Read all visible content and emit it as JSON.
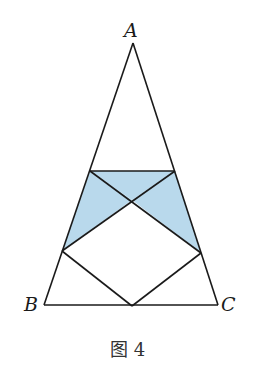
{
  "figure": {
    "caption": "图 4",
    "colors": {
      "shade": "#b9d9ec",
      "stroke": "#1a1a1a",
      "background": "#ffffff"
    },
    "labels": {
      "A": "A",
      "B": "B",
      "C": "C"
    },
    "points": {
      "A": [
        133,
        43
      ],
      "B": [
        44,
        305
      ],
      "C": [
        218,
        305
      ],
      "D": [
        90,
        171
      ],
      "E": [
        175,
        171
      ],
      "F": [
        62,
        251
      ],
      "G": [
        201,
        253
      ],
      "M": [
        132,
        306
      ],
      "O": [
        132,
        200
      ]
    },
    "segments": [
      [
        "A",
        "B"
      ],
      [
        "A",
        "C"
      ],
      [
        "B",
        "C"
      ],
      [
        "D",
        "E"
      ],
      [
        "D",
        "G"
      ],
      [
        "E",
        "F"
      ],
      [
        "F",
        "M"
      ],
      [
        "G",
        "M"
      ]
    ],
    "shaded_regions": [
      [
        "D",
        "E",
        "O"
      ],
      [
        "D",
        "O",
        "F"
      ],
      [
        "E",
        "G",
        "O"
      ]
    ]
  }
}
